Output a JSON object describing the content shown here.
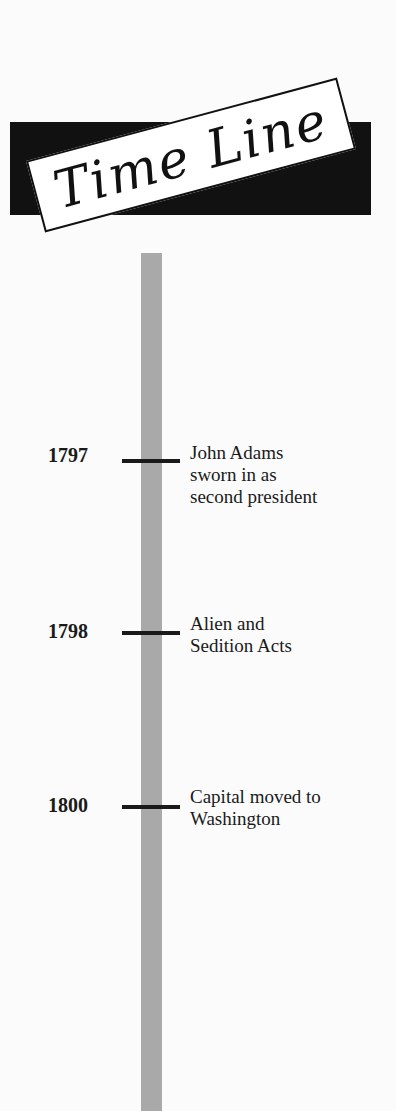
{
  "header": {
    "title": "Time Line"
  },
  "timeline": {
    "bar_color": "#a9a9a9",
    "entries": [
      {
        "year": "1797",
        "event": "John Adams sworn in as second president"
      },
      {
        "year": "1798",
        "event": "Alien and Sedition Acts"
      },
      {
        "year": "1800",
        "event": "Capital moved to Washington"
      }
    ]
  }
}
